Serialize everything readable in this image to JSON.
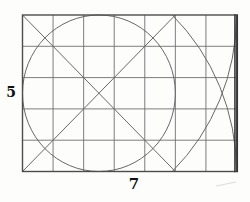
{
  "figure": {
    "name": "rectangle-grid-circle-construction",
    "labels": {
      "height": "5",
      "width": "7"
    },
    "grid": {
      "cols": 7,
      "rows": 5
    },
    "colors": {
      "background": "#fdfdfc",
      "grid_line": "#6f6f6f",
      "curve_line": "#686868",
      "border": "#4d4d4d",
      "border_right_dark": "#353535",
      "label_text": "#111111",
      "smudge": "#dcdcda"
    },
    "geometry": {
      "canvas": {
        "width": 250,
        "height": 202
      },
      "rect": {
        "left": 22.5,
        "top": 15,
        "right": 236.5,
        "bottom": 171.5
      },
      "circle": {
        "cx": 98.93,
        "cy": 93.25,
        "rx": 76.43,
        "ry": 78.25
      },
      "diagonals": [
        {
          "name": "diagonal-down",
          "x1": 22.5,
          "y1": 15,
          "x2": 175.36,
          "y2": 171.5
        },
        {
          "name": "diagonal-up",
          "x1": 22.5,
          "y1": 171.5,
          "x2": 175.36,
          "y2": 15
        }
      ],
      "arcs": [
        {
          "name": "corner-arc-top",
          "rx": 214,
          "ry": 219.1,
          "sweep": 1,
          "x1": 236.5,
          "y1": 15,
          "x2": 172.27,
          "y2": 171.5
        },
        {
          "name": "corner-arc-bottom",
          "rx": 214,
          "ry": 219.1,
          "sweep": 0,
          "x1": 236.5,
          "y1": 171.5,
          "x2": 172.27,
          "y2": 15
        }
      ],
      "right_border_lines": [
        234.9,
        237.3
      ],
      "smudge": {
        "x1": 216,
        "y1": 186,
        "x2": 236,
        "y2": 182
      }
    }
  }
}
